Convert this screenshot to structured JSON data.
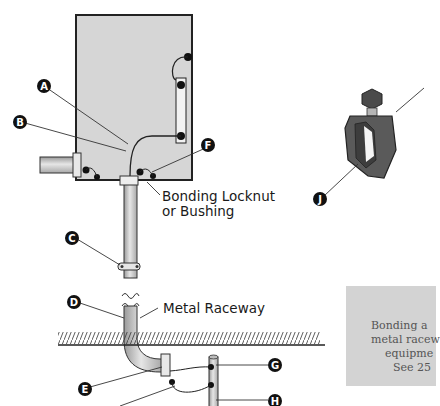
{
  "diagram": {
    "type": "electrical-bonding-illustration",
    "callouts": [
      {
        "id": "A",
        "label": "A"
      },
      {
        "id": "B",
        "label": "B"
      },
      {
        "id": "C",
        "label": "C"
      },
      {
        "id": "D",
        "label": "D"
      },
      {
        "id": "E",
        "label": "E"
      },
      {
        "id": "F",
        "label": "F"
      },
      {
        "id": "G",
        "label": "G"
      },
      {
        "id": "H",
        "label": "H"
      },
      {
        "id": "J",
        "label": "J"
      }
    ],
    "text_labels": {
      "bonding_line1": "Bonding Locknut",
      "bonding_line2": "or Bushing",
      "raceway": "Metal Raceway"
    },
    "note": {
      "lines": [
        "Bonding a",
        "metal racew",
        "equipme",
        "See 25"
      ]
    },
    "colors": {
      "enclosure": "#d6d6d6",
      "conduit": "#c8c8c8",
      "clamp": "#5a5a5a",
      "note_bg": "#d3d3d3",
      "callout_bg": "#111111"
    }
  }
}
